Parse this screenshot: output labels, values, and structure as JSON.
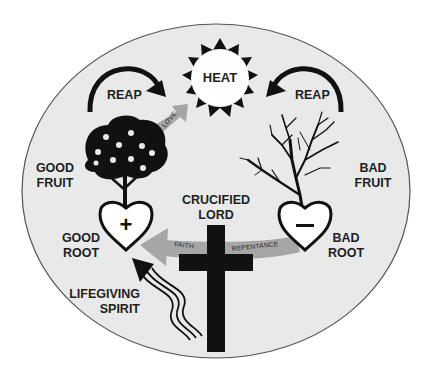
{
  "diagram": {
    "colors": {
      "oval_fill": "#e9e9e9",
      "oval_stroke": "#555555",
      "ink": "#111111",
      "band": "#a6a6a6",
      "label": "#1e1e1e"
    },
    "sun": {
      "label": "HEAT"
    },
    "left_arrow": {
      "label": "REAP"
    },
    "right_arrow": {
      "label": "REAP"
    },
    "love_arrow": {
      "label": "LOVE"
    },
    "good_tree": {
      "label_line1": "GOOD",
      "label_line2": "FRUIT"
    },
    "bad_tree": {
      "label_line1": "BAD",
      "label_line2": "FRUIT"
    },
    "good_heart": {
      "symbol": "+",
      "label_line1": "GOOD",
      "label_line2": "ROOT"
    },
    "bad_heart": {
      "symbol": "−",
      "label_line1": "BAD",
      "label_line2": "ROOT"
    },
    "cross": {
      "label_line1": "CRUCIFIED",
      "label_line2": "LORD"
    },
    "band": {
      "left_label": "FAITH",
      "right_label": "REPENTANCE"
    },
    "spirit": {
      "label_line1": "LIFEGIVING",
      "label_line2": "SPIRIT"
    }
  }
}
